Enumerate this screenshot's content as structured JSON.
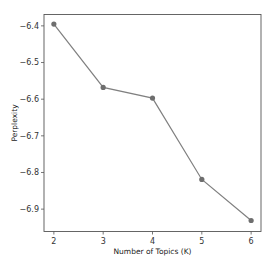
{
  "chart_data": {
    "type": "line",
    "title": "",
    "xlabel": "Number of Topics (K)",
    "ylabel": "Perplexity",
    "x": [
      2,
      3,
      4,
      5,
      6
    ],
    "series": [
      {
        "name": "Perplexity",
        "values": [
          -6.395,
          -6.568,
          -6.597,
          -6.819,
          -6.931
        ],
        "color": "#808080",
        "marker": "circle",
        "marker_color": "#6e6e6e"
      }
    ],
    "xticks": [
      2,
      3,
      4,
      5,
      6
    ],
    "xtick_labels": [
      "2",
      "3",
      "4",
      "5",
      "6"
    ],
    "yticks": [
      -6.4,
      -6.5,
      -6.6,
      -6.7,
      -6.8,
      -6.9
    ],
    "ytick_labels": [
      "−6.4",
      "−6.5",
      "−6.6",
      "−6.7",
      "−6.8",
      "−6.9"
    ],
    "xlim": [
      1.8,
      6.2
    ],
    "ylim": [
      -6.961,
      -6.369
    ],
    "grid": false,
    "legend": null
  },
  "layout": {
    "plot_left": 44,
    "plot_right": 261,
    "plot_top": 14.5,
    "plot_bottom": 231.5
  }
}
